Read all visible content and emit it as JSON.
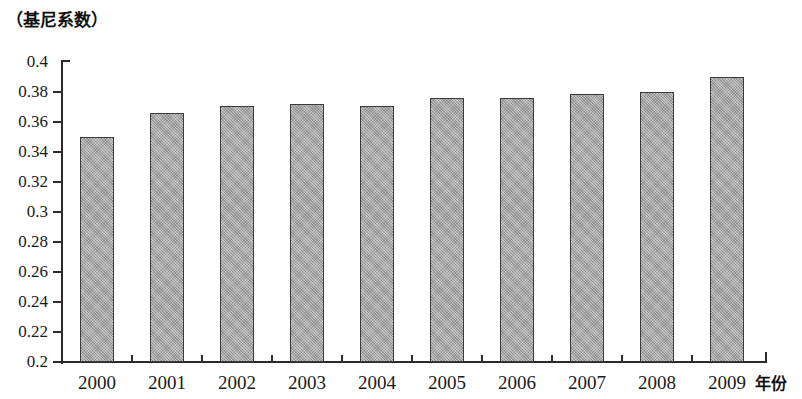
{
  "chart_data": {
    "type": "bar",
    "title": "（基尼系数）",
    "xlabel": "年份",
    "ylabel": "（基尼系数）",
    "categories": [
      "2000",
      "2001",
      "2002",
      "2003",
      "2004",
      "2005",
      "2006",
      "2007",
      "2008",
      "2009"
    ],
    "values": [
      0.35,
      0.366,
      0.371,
      0.372,
      0.371,
      0.376,
      0.376,
      0.379,
      0.38,
      0.39
    ],
    "ylim": [
      0.2,
      0.4
    ],
    "ytick_step": 0.02,
    "ytick_labels": [
      "0.4",
      "0.38",
      "0.36",
      "0.34",
      "0.32",
      "0.3",
      "0.28",
      "0.26",
      "0.24",
      "0.22",
      "0.2"
    ],
    "ytick_values": [
      0.4,
      0.38,
      0.36,
      0.34,
      0.32,
      0.3,
      0.28,
      0.26,
      0.24,
      0.22,
      0.2
    ],
    "grid": false,
    "legend": false,
    "legend_position": "none",
    "series": [
      {
        "name": "基尼系数",
        "values": [
          0.35,
          0.366,
          0.371,
          0.372,
          0.371,
          0.376,
          0.376,
          0.379,
          0.38,
          0.39
        ]
      }
    ],
    "colors": {
      "bar_fill": "#a9a9a9",
      "bar_border": "#3a3a3a",
      "axis": "#2b2b2b",
      "text": "#1a1a1a",
      "background": "#ffffff"
    }
  }
}
